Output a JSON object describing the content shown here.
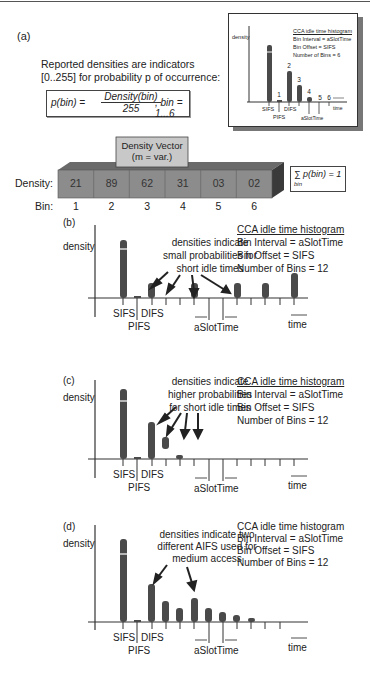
{
  "panel_a": {
    "label": "(a)",
    "intro_line1": "Reported densities are indicators",
    "intro_line2": "[0..255] for probability p of occurrence:",
    "formula": {
      "lhs": "p(bin) =",
      "numerator": "Density(bin)",
      "denominator": "255",
      "rhs": ", bin = 1...6"
    },
    "vector_title_line1": "Density Vector",
    "vector_title_line2": "(m = var.)",
    "density_label": "Density:",
    "bin_label": "Bin:",
    "densities": [
      "21",
      "89",
      "62",
      "31",
      "03",
      "02"
    ],
    "bins": [
      "1",
      "2",
      "3",
      "4",
      "5",
      "6"
    ],
    "sum_formula": "∑ p(bin) = 1",
    "sum_sub": "bin",
    "inset": {
      "y_label": "density",
      "title": "CCA idle time histogram",
      "line1": "Bin Interval = aSlotTime",
      "line2": "Bin Offset = SIFS",
      "line3": "Number of Bins = 6",
      "bin_numbers": [
        "1",
        "2",
        "3",
        "4",
        "5",
        "6"
      ],
      "sifs": "SIFS",
      "pifs": "PIFS",
      "difs": "DIFS",
      "slot": "aSlotTime",
      "time": "time"
    }
  },
  "panels": [
    {
      "label": "(b)",
      "y_label": "density",
      "note_lines": [
        "densities indicate",
        "small probabilities for",
        "short idle times"
      ],
      "hist_title": "CCA idle time histogram",
      "hist_line1": "Bin Interval = aSlotTime",
      "hist_line2": "Bin Offset = SIFS",
      "hist_line3": "Number of Bins = 12",
      "sifs": "SIFS",
      "pifs": "PIFS",
      "difs": "DIFS",
      "slot": "aSlotTime",
      "time": "time"
    },
    {
      "label": "(c)",
      "y_label": "density",
      "note_lines": [
        "densities indicate",
        "higher probabilities",
        "for short idle times"
      ],
      "hist_title": "CCA idle time histogram",
      "hist_line1": "Bin Interval = aSlotTime",
      "hist_line2": "Bin Offset = SIFS",
      "hist_line3": "Number of Bins = 12",
      "sifs": "SIFS",
      "pifs": "PIFS",
      "difs": "DIFS",
      "slot": "aSlotTime",
      "time": "time"
    },
    {
      "label": "(d)",
      "y_label": "density",
      "note_lines": [
        "densities indicate two",
        "different AIFS used for",
        "medium access"
      ],
      "hist_title": "CCA idle time histogram",
      "hist_line1": "Bin Interval = aSlotTime",
      "hist_line2": "Bin Offset = SIFS",
      "hist_line3": "Number of Bins = 12",
      "sifs": "SIFS",
      "pifs": "PIFS",
      "difs": "DIFS",
      "slot": "aSlotTime",
      "time": "time"
    }
  ],
  "colors": {
    "bar": "#4a4a4a",
    "vector_face": "#8c8c8c",
    "vector_top": "#6a6a6a",
    "vector_side": "#3a3a3a",
    "title_box": "#c8c8c8"
  }
}
